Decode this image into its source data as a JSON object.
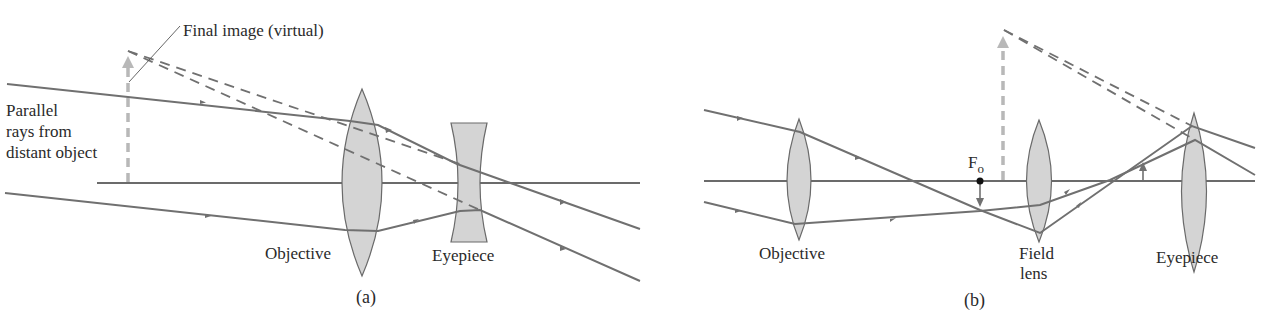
{
  "colors": {
    "ray": "#707070",
    "axis": "#3a3a3a",
    "lens_fill": "#d4d4d4",
    "lens_stroke": "#6a6a6a",
    "image_arrow": "#b8b8b8",
    "text": "#2a2a2a"
  },
  "panel_a": {
    "caption": "(a)",
    "labels": {
      "final_image": "Final image (virtual)",
      "parallel_line1": "Parallel",
      "parallel_line2": "rays from",
      "parallel_line3": "distant object",
      "objective": "Objective",
      "eyepiece": "Eyepiece"
    },
    "components": [
      {
        "name": "Objective",
        "type": "converging lens"
      },
      {
        "name": "Eyepiece",
        "type": "diverging lens"
      }
    ]
  },
  "panel_b": {
    "caption": "(b)",
    "labels": {
      "focal_point": "F",
      "focal_point_sub": "o",
      "objective": "Objective",
      "field_line1": "Field",
      "field_line2": "lens",
      "eyepiece": "Eyepiece"
    },
    "components": [
      {
        "name": "Objective",
        "type": "converging lens"
      },
      {
        "name": "Field lens",
        "type": "converging lens"
      },
      {
        "name": "Eyepiece",
        "type": "converging lens"
      }
    ]
  }
}
